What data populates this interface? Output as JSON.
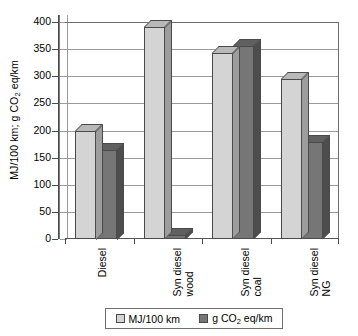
{
  "chart_data": {
    "type": "bar",
    "title": "",
    "xlabel": "",
    "ylabel": "MJ/100 km; g CO2 eq/km",
    "ylabel_parts": {
      "pre": "MJ/100 km; g CO",
      "sub": "2",
      "post": " eq/km"
    },
    "categories": [
      "Diesel",
      "Syn diesel wood",
      "Syn diesel coal",
      "Syn diesel NG"
    ],
    "category_lines": [
      [
        "Diesel"
      ],
      [
        "Syn diesel",
        "wood"
      ],
      [
        "Syn diesel",
        "coal"
      ],
      [
        "Syn diesel",
        "NG"
      ]
    ],
    "series": [
      {
        "name": "MJ/100 km",
        "color": "#d4d4d4",
        "values": [
          200,
          390,
          343,
          295
        ]
      },
      {
        "name": "g CO2 eq/km",
        "color": "#767676",
        "values": [
          165,
          8,
          355,
          178
        ]
      }
    ],
    "legend": [
      {
        "label": "MJ/100 km",
        "label_parts": {
          "pre": "MJ/100 km",
          "sub": "",
          "post": ""
        },
        "color": "#d4d4d4"
      },
      {
        "label": "g CO2 eq/km",
        "label_parts": {
          "pre": "g CO",
          "sub": "2",
          "post": " eq/km"
        },
        "color": "#767676"
      }
    ],
    "legend_position": "bottom",
    "ylim": [
      0,
      400
    ],
    "yticks": [
      0,
      50,
      100,
      150,
      200,
      250,
      300,
      350,
      400
    ],
    "ytick_labels": [
      "0",
      "50",
      "100",
      "150",
      "200",
      "250",
      "300",
      "350",
      "400"
    ],
    "grid": true,
    "grid_axis": "y",
    "style": "3d-bar",
    "colors": {
      "light_series": "#d4d4d4",
      "dark_series": "#767676",
      "gridline": "#9a9a9a",
      "axis": "#4a4a4a",
      "background": "#ffffff"
    }
  }
}
